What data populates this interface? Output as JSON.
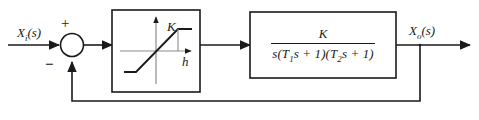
{
  "diagram": {
    "type": "control-system-block-diagram",
    "line_color": "#1a1a1a",
    "axis_color": "#8c8c8c",
    "background": "#ffffff"
  },
  "signals": {
    "input": {
      "symbol": "X",
      "subscript": "i",
      "argument": "(s)",
      "full": "Xi(s)"
    },
    "output": {
      "symbol": "X",
      "subscript": "o",
      "argument": "(s)",
      "full": "Xo(s)"
    }
  },
  "summing_junction": {
    "name": "summing-junction",
    "plus_sign": "+",
    "minus_sign": "−",
    "shape": "circle"
  },
  "nonlinearity_block": {
    "name": "saturation-block",
    "gain_label": "K",
    "breakpoint_label": "h",
    "characteristic": "saturation"
  },
  "transfer_function_block": {
    "name": "plant-transfer-function",
    "numerator": "K",
    "denominator_parts": [
      "s",
      "(T",
      "1",
      "s + 1)",
      "(T",
      "2",
      "s + 1)"
    ],
    "denominator_plain": "s(T1s + 1)(T2s + 1)"
  },
  "feedback": {
    "name": "unity-feedback-path",
    "gain": "1",
    "sign": "negative"
  }
}
